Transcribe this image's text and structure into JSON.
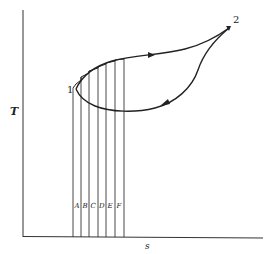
{
  "diagram": {
    "type": "T-s cycle diagram",
    "axes": {
      "y_label": "T",
      "x_label": "s"
    },
    "points": [
      {
        "label": "1"
      },
      {
        "label": "2"
      }
    ],
    "strips": [
      "A",
      "B",
      "C",
      "D",
      "E",
      "F"
    ],
    "colors": {
      "line": "#222222",
      "background": "#ffffff"
    }
  }
}
